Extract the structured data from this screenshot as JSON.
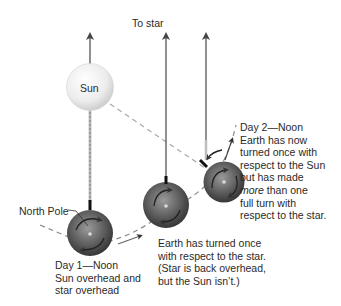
{
  "labels": {
    "to_star": "To star",
    "sun": "Sun",
    "north_pole": "North Pole",
    "day1": {
      "line1": "Day 1—Noon",
      "line2": "Sun overhead and",
      "line3": "star overhead"
    },
    "middle": {
      "line1": "Earth has turned once",
      "line2": "with respect to the star.",
      "line3": "(Star is back overhead,",
      "line4": "but the Sun isn’t.)"
    },
    "day2": {
      "line1": "Day 2—Noon",
      "line2": "Earth has now",
      "line3": "turned once with",
      "line4": "respect to the Sun",
      "line5": "but has made",
      "line6_em": "more",
      "line6_rest": " than one",
      "line7": "full turn with",
      "line8": "respect to the star."
    }
  },
  "colors": {
    "sun_fill": "#ececec",
    "earth_fill": "#5a5a5a",
    "line": "#555555",
    "dashed": "#9a9a9a",
    "text": "#2a2a2a"
  }
}
